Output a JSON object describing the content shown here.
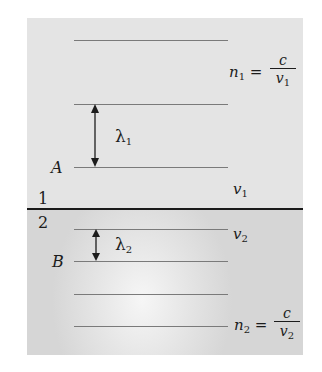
{
  "diagram": {
    "medium1": {
      "number_label": "1",
      "point_label": "A",
      "wavelength_symbol": "λ",
      "wavelength_subscript": "1",
      "speed_symbol": "v",
      "speed_subscript": "1",
      "index_formula": {
        "lhs_symbol": "n",
        "lhs_subscript": "1",
        "equals": "=",
        "numerator": "c",
        "denominator_symbol": "v",
        "denominator_subscript": "1"
      },
      "wavefront_y": [
        40,
        104,
        167
      ]
    },
    "medium2": {
      "number_label": "2",
      "point_label": "B",
      "wavelength_symbol": "λ",
      "wavelength_subscript": "2",
      "speed_symbol": "v",
      "speed_subscript": "2",
      "index_formula": {
        "lhs_symbol": "n",
        "lhs_subscript": "2",
        "equals": "=",
        "numerator": "c",
        "denominator_symbol": "v",
        "denominator_subscript": "2"
      },
      "wavefront_y": [
        229,
        261,
        294,
        326
      ]
    },
    "colors": {
      "medium1_bg": "#e4e4e4",
      "medium2_bg": "#d6d6d6",
      "interface_line": "#1a1a1a",
      "wavefront_line": "#7a7a7a",
      "text": "#1c1c1c"
    }
  }
}
